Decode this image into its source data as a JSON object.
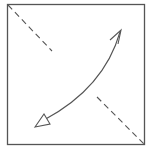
{
  "diagram": {
    "type": "fold-diagram",
    "colors": {
      "background": "#ffffff",
      "square_stroke": "#555555",
      "dashed_line": "#555555",
      "arrow": "#555555"
    },
    "elements": {
      "square": {
        "shape": "paper-square"
      },
      "fold_line": {
        "style": "valley-fold-dashed",
        "direction": "diagonal-top-left-to-bottom-right"
      },
      "arrow": {
        "shape": "curved-double-arrow",
        "from": "top-right",
        "to": "bottom-left"
      }
    }
  }
}
